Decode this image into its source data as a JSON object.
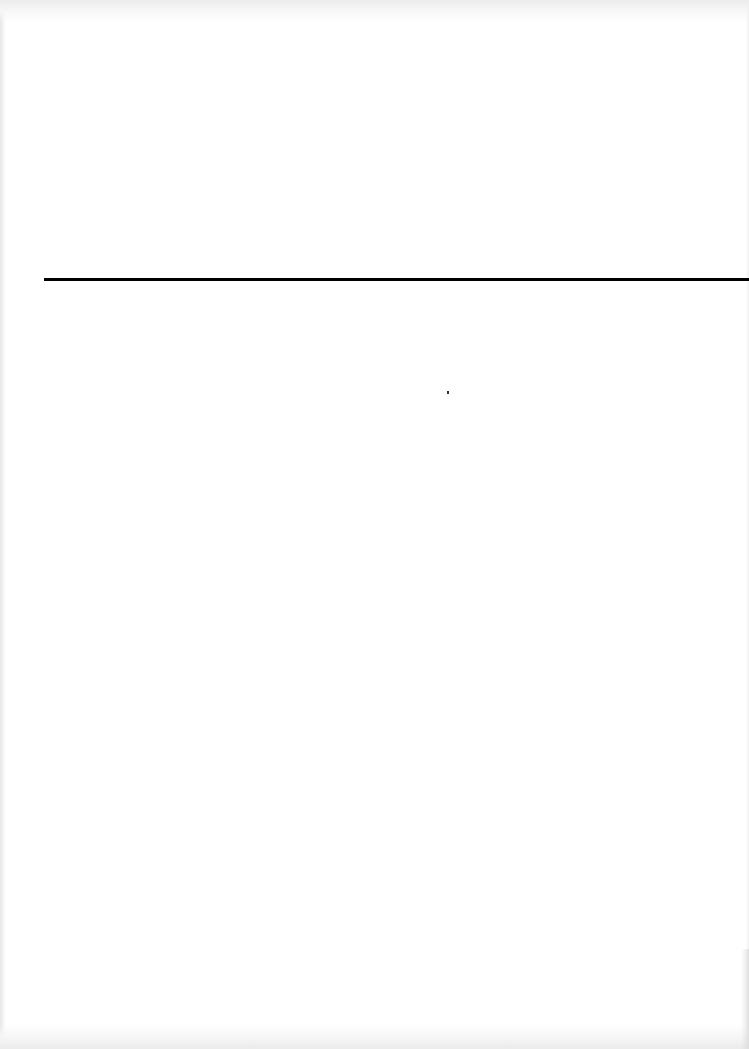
{
  "page": {
    "type": "scanned-blank-page",
    "background_color": "#ffffff",
    "rule": {
      "color": "#000000",
      "thickness_px": 3,
      "y": 279,
      "x_start": 44,
      "x_end": 749
    },
    "text_content": ""
  }
}
